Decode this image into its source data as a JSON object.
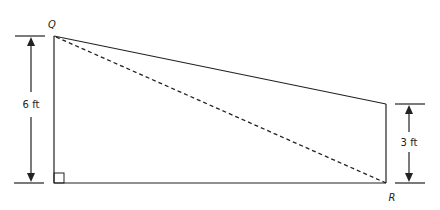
{
  "diagram": {
    "type": "trapezoid-geometry",
    "points": {
      "Q": {
        "label": "Q",
        "x": 54,
        "y": 36
      },
      "bottom_left": {
        "x": 54,
        "y": 183
      },
      "R": {
        "label": "R",
        "x": 386,
        "y": 183
      },
      "top_right": {
        "x": 386,
        "y": 104
      }
    },
    "dimensions": {
      "left_height": "6 ft",
      "right_height": "3 ft"
    },
    "right_angle_marker": "bottom-left",
    "diagonal": "Q to R (dashed)",
    "colors": {
      "line": "#222222",
      "background": "#ffffff"
    }
  }
}
